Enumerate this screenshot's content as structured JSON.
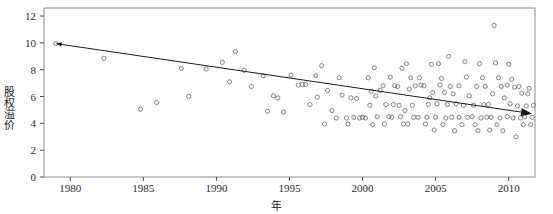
{
  "chart_data": {
    "type": "scatter",
    "title": "",
    "xlabel": "年",
    "ylabel": "股权溢价",
    "xlim": [
      1978.2,
      2011.8
    ],
    "ylim": [
      0,
      12.6
    ],
    "xticks": [
      1980,
      1985,
      1990,
      1995,
      2000,
      2005,
      2010
    ],
    "yticks": [
      0,
      2,
      4,
      6,
      8,
      10,
      12
    ],
    "grid": false,
    "legend": null,
    "marker": {
      "shape": "open-circle",
      "size": 3,
      "color": "#666666"
    },
    "trendline": {
      "name": "trend-arrow",
      "style": "solid",
      "color": "#1a1a1a",
      "arrow_start": true,
      "arrow_end": true,
      "x_start": 1979.0,
      "y_start": 9.95,
      "x_end": 2011.6,
      "y_end": 4.72
    },
    "points": [
      [
        1979.0,
        9.95
      ],
      [
        1982.3,
        8.85
      ],
      [
        1984.8,
        5.05
      ],
      [
        1985.9,
        5.55
      ],
      [
        1987.6,
        8.1
      ],
      [
        1989.3,
        8.05
      ],
      [
        1990.4,
        8.55
      ],
      [
        1991.3,
        9.35
      ],
      [
        1991.9,
        7.95
      ],
      [
        1993.2,
        7.55
      ],
      [
        1993.9,
        6.05
      ],
      [
        1994.6,
        4.85
      ],
      [
        1995.1,
        7.6
      ],
      [
        1995.6,
        6.85
      ],
      [
        1995.9,
        6.9
      ],
      [
        1996.1,
        6.9
      ],
      [
        1996.4,
        5.4
      ],
      [
        1996.8,
        7.55
      ],
      [
        1997.2,
        8.3
      ],
      [
        1997.6,
        6.45
      ],
      [
        1997.9,
        4.95
      ],
      [
        1998.2,
        4.4
      ],
      [
        1998.6,
        6.1
      ],
      [
        1998.9,
        4.4
      ],
      [
        1999.2,
        5.9
      ],
      [
        1999.4,
        4.45
      ],
      [
        1999.6,
        5.85
      ],
      [
        1999.8,
        4.4
      ],
      [
        2000.0,
        4.45
      ],
      [
        2000.2,
        4.4
      ],
      [
        2000.4,
        7.4
      ],
      [
        2000.6,
        6.4
      ],
      [
        2000.8,
        8.15
      ],
      [
        2000.9,
        6.05
      ],
      [
        2001.0,
        4.5
      ],
      [
        2001.2,
        6.45
      ],
      [
        2001.4,
        6.8
      ],
      [
        2001.6,
        5.4
      ],
      [
        2001.8,
        4.5
      ],
      [
        2002.0,
        4.45
      ],
      [
        2002.2,
        6.8
      ],
      [
        2002.4,
        6.75
      ],
      [
        2002.6,
        4.5
      ],
      [
        2002.8,
        3.95
      ],
      [
        2003.0,
        8.45
      ],
      [
        2003.2,
        6.55
      ],
      [
        2003.4,
        5.35
      ],
      [
        2003.6,
        6.8
      ],
      [
        2003.8,
        4.45
      ],
      [
        2004.0,
        6.85
      ],
      [
        2004.2,
        6.8
      ],
      [
        2004.4,
        4.45
      ],
      [
        2004.6,
        5.9
      ],
      [
        2004.8,
        6.3
      ],
      [
        2005.0,
        4.45
      ],
      [
        2005.1,
        5.45
      ],
      [
        2005.3,
        6.85
      ],
      [
        2005.5,
        3.9
      ],
      [
        2005.7,
        4.4
      ],
      [
        2005.9,
        9.0
      ],
      [
        2006.0,
        6.75
      ],
      [
        2006.2,
        6.2
      ],
      [
        2006.4,
        5.45
      ],
      [
        2006.6,
        4.45
      ],
      [
        2006.8,
        3.9
      ],
      [
        2007.0,
        8.6
      ],
      [
        2007.1,
        7.45
      ],
      [
        2007.3,
        6.05
      ],
      [
        2007.5,
        4.5
      ],
      [
        2007.7,
        3.9
      ],
      [
        2007.9,
        3.45
      ],
      [
        2008.0,
        8.45
      ],
      [
        2008.2,
        7.4
      ],
      [
        2008.4,
        6.75
      ],
      [
        2008.6,
        5.4
      ],
      [
        2008.8,
        4.45
      ],
      [
        2009.0,
        11.3
      ],
      [
        2009.1,
        8.5
      ],
      [
        2009.3,
        7.4
      ],
      [
        2009.5,
        6.75
      ],
      [
        2009.7,
        5.9
      ],
      [
        2009.9,
        4.5
      ],
      [
        2010.0,
        8.4
      ],
      [
        2010.2,
        7.3
      ],
      [
        2010.4,
        6.7
      ],
      [
        2010.6,
        5.3
      ],
      [
        2010.8,
        4.4
      ],
      [
        2011.0,
        3.9
      ],
      [
        2011.2,
        5.3
      ],
      [
        2011.4,
        6.6
      ],
      [
        2011.6,
        4.45
      ],
      [
        1988.1,
        6.0
      ],
      [
        1992.4,
        6.75
      ],
      [
        1994.2,
        5.9
      ],
      [
        1996.9,
        5.95
      ],
      [
        1998.4,
        7.4
      ],
      [
        2001.9,
        7.45
      ],
      [
        2003.9,
        7.4
      ],
      [
        2005.4,
        7.35
      ],
      [
        2006.9,
        5.35
      ],
      [
        2008.9,
        6.2
      ],
      [
        2010.9,
        6.25
      ],
      [
        1993.5,
        4.9
      ],
      [
        1997.4,
        3.95
      ],
      [
        1999.0,
        3.95
      ],
      [
        2002.9,
        4.95
      ],
      [
        2004.9,
        3.5
      ],
      [
        2006.3,
        3.45
      ],
      [
        2007.6,
        5.35
      ],
      [
        2009.6,
        3.45
      ],
      [
        2010.5,
        3.0
      ],
      [
        2011.5,
        3.9
      ],
      [
        1990.9,
        7.1
      ],
      [
        2000.5,
        5.35
      ],
      [
        2002.5,
        5.35
      ],
      [
        2004.5,
        5.4
      ],
      [
        2005.8,
        5.4
      ],
      [
        2008.5,
        4.45
      ],
      [
        2009.9,
        6.85
      ],
      [
        2003.5,
        4.45
      ],
      [
        2001.5,
        3.95
      ],
      [
        2006.6,
        6.8
      ],
      [
        2007.8,
        6.75
      ],
      [
        2008.3,
        5.4
      ],
      [
        2010.1,
        5.45
      ],
      [
        2011.1,
        4.5
      ],
      [
        2004.3,
        3.95
      ],
      [
        2005.6,
        6.3
      ],
      [
        2009.4,
        4.4
      ],
      [
        2002.1,
        5.4
      ],
      [
        2000.7,
        3.9
      ],
      [
        2003.1,
        3.95
      ],
      [
        2007.2,
        4.45
      ],
      [
        2008.7,
        3.5
      ],
      [
        2010.3,
        4.4
      ],
      [
        2011.3,
        6.2
      ],
      [
        2006.1,
        4.45
      ],
      [
        2009.2,
        3.9
      ],
      [
        2005.2,
        8.45
      ],
      [
        2003.3,
        7.4
      ],
      [
        2004.7,
        8.4
      ],
      [
        2002.7,
        8.1
      ],
      [
        2008.1,
        4.4
      ],
      [
        2010.7,
        6.75
      ],
      [
        2011.7,
        5.35
      ]
    ]
  }
}
